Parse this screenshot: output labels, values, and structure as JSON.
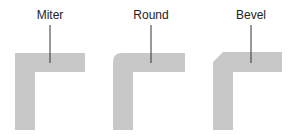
{
  "diagram": {
    "joins": [
      {
        "label": "Miter",
        "type": "miter",
        "cx": 50
      },
      {
        "label": "Round",
        "type": "round",
        "cx": 151
      },
      {
        "label": "Bevel",
        "type": "bevel",
        "cx": 251
      }
    ],
    "colors": {
      "shape": "#c8c8c8",
      "leader": "#333333",
      "text": "#222222"
    }
  }
}
